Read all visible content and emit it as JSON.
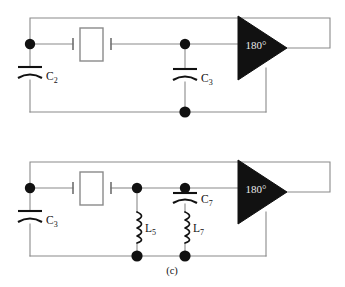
{
  "figure": {
    "caption": "(c)",
    "background_color": "#ffffff",
    "wire_color": "#8a8a8a",
    "node_color": "#111111",
    "amplifier_fill": "#111111",
    "amplifier_text_color": "#e8e8e8"
  },
  "circuits": [
    {
      "id": "upper-circuit",
      "amplifier": {
        "label": "180°",
        "name": "inverting-amplifier"
      },
      "crystal": {
        "name": "quartz-crystal",
        "label": ""
      },
      "components": [
        {
          "name": "capacitor-c2",
          "type": "capacitor",
          "label_main": "C",
          "label_sub": "2"
        },
        {
          "name": "capacitor-c3",
          "type": "capacitor",
          "label_main": "C",
          "label_sub": "3"
        }
      ],
      "nodes": 3
    },
    {
      "id": "lower-circuit",
      "amplifier": {
        "label": "180°",
        "name": "inverting-amplifier"
      },
      "crystal": {
        "name": "quartz-crystal",
        "label": ""
      },
      "components": [
        {
          "name": "capacitor-c3",
          "type": "capacitor",
          "label_main": "C",
          "label_sub": "3"
        },
        {
          "name": "capacitor-c7",
          "type": "capacitor",
          "label_main": "C",
          "label_sub": "7"
        },
        {
          "name": "inductor-l5",
          "type": "inductor",
          "label_main": "L",
          "label_sub": "5"
        },
        {
          "name": "inductor-l7",
          "type": "inductor",
          "label_main": "L",
          "label_sub": "7"
        }
      ],
      "nodes": 6
    }
  ]
}
